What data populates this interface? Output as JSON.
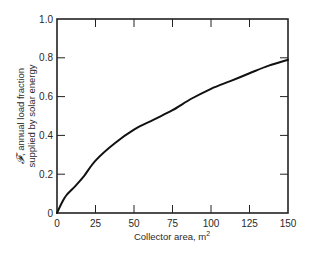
{
  "chart_data": {
    "type": "line",
    "title": "",
    "xlabel": "Collector area, m",
    "xlabel_superscript": "2",
    "ylabel_symbol": "𝓕",
    "ylabel_line1": ", annual load fraction",
    "ylabel_line2": "supplied by solar energy",
    "xlim": [
      0,
      150
    ],
    "ylim": [
      0,
      1.0
    ],
    "x_ticks": [
      0,
      25,
      50,
      75,
      100,
      125,
      150
    ],
    "x_tick_labels": [
      "0",
      "25",
      "50",
      "75",
      "100",
      "125",
      "150"
    ],
    "y_ticks": [
      0,
      0.2,
      0.4,
      0.6,
      0.8,
      1.0
    ],
    "y_tick_labels": [
      "0",
      "0.2",
      "0.4",
      "0.6",
      "0.8",
      "1.0"
    ],
    "grid": false,
    "legend": null,
    "series": [
      {
        "name": "annual load fraction",
        "x": [
          0,
          3,
          6,
          12,
          17.5,
          25,
          37.5,
          50,
          62.5,
          75,
          87.5,
          100,
          112.5,
          125,
          137.5,
          150
        ],
        "values": [
          0,
          0.05,
          0.09,
          0.14,
          0.19,
          0.27,
          0.36,
          0.43,
          0.48,
          0.53,
          0.59,
          0.64,
          0.68,
          0.72,
          0.76,
          0.79
        ]
      }
    ]
  },
  "colors": {
    "line": "#111111",
    "axis": "#222222",
    "text": "#2a2a2a",
    "background": "#ffffff"
  }
}
